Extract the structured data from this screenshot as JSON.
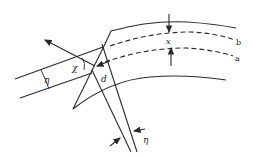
{
  "figure": {
    "labels": {
      "eta_left": "η",
      "chi": "χ",
      "d": "d",
      "x": "x",
      "b": "b",
      "a": "a",
      "eta_bottom": "η"
    },
    "line_styles": {
      "crystal_surfaces": "solid",
      "planes_a_b": "dashed"
    },
    "stroke_color": "#2a2a2a",
    "background": "#ffffff"
  }
}
